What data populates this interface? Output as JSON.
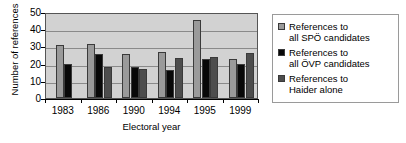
{
  "chart_data": {
    "type": "bar",
    "title": "",
    "xlabel": "Electoral year",
    "ylabel": "Number of references",
    "categories": [
      "1983",
      "1986",
      "1990",
      "1994",
      "1995",
      "1999"
    ],
    "ylim": [
      0,
      50
    ],
    "yticks": [
      0,
      10,
      20,
      30,
      40,
      50
    ],
    "grid": true,
    "legend_position": "right",
    "series": [
      {
        "name": "References to all SPÖ candidates",
        "label_line1": "References to",
        "label_line2": "all SPÖ candidates",
        "color": "#9a9a9a",
        "values": [
          31,
          31.5,
          25.5,
          26.5,
          45.5,
          22.5
        ]
      },
      {
        "name": "References to all ÖVP candidates",
        "label_line1": "References to",
        "label_line2": "all ÖVP candidates",
        "color": "#080808",
        "values": [
          20,
          25.5,
          18,
          16,
          22.5,
          19.5
        ]
      },
      {
        "name": "References to Haider alone",
        "label_line1": "References to",
        "label_line2": "Haider alone",
        "color": "#4d4d4d",
        "values": [
          null,
          18,
          17,
          23.5,
          24,
          26
        ]
      }
    ]
  }
}
